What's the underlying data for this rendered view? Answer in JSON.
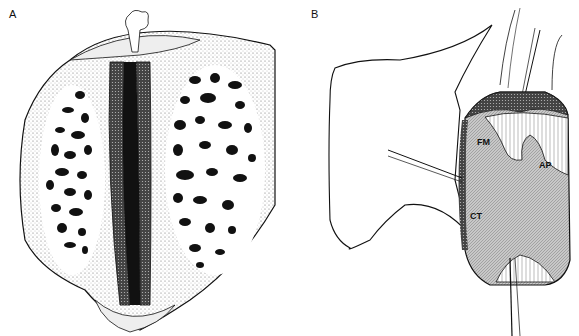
{
  "figure": {
    "panels": [
      {
        "id": "A",
        "label": "A",
        "description": "Cross-section of bone showing cancellous (trabecular) bone on both sides of a central dark cleft"
      },
      {
        "id": "B",
        "label": "B",
        "description": "Surgical exposure with retracted tissue and labeled regions",
        "annotations": [
          {
            "text": "FM"
          },
          {
            "text": "AP"
          },
          {
            "text": "CT"
          }
        ]
      }
    ]
  }
}
